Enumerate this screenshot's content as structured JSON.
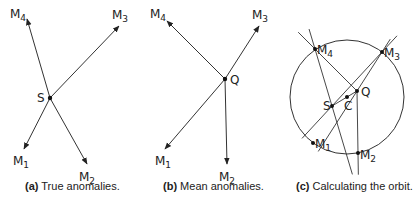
{
  "figure": {
    "panels": [
      {
        "id": "a",
        "caption_tag": "(a)",
        "caption_text": "True anomalies.",
        "center_label": "S",
        "center": [
          50,
          98
        ],
        "arrows": [
          {
            "label": "M",
            "sub": "1",
            "tip": [
              24,
              149
            ],
            "label_pos": [
              13,
              165
            ]
          },
          {
            "label": "M",
            "sub": "2",
            "tip": [
              87,
              164
            ],
            "label_pos": [
              79,
              181
            ]
          },
          {
            "label": "M",
            "sub": "3",
            "tip": [
              119,
              26
            ],
            "label_pos": [
              112,
              19
            ]
          },
          {
            "label": "M",
            "sub": "4",
            "tip": [
              27,
              19
            ],
            "label_pos": [
              10,
              18
            ]
          }
        ]
      },
      {
        "id": "b",
        "caption_tag": "(b)",
        "caption_text": "Mean anomalies.",
        "center_label": "Q",
        "center": [
          225,
          79
        ],
        "arrows": [
          {
            "label": "M",
            "sub": "1",
            "tip": [
              165,
              149
            ],
            "label_pos": [
              155,
              165
            ]
          },
          {
            "label": "M",
            "sub": "2",
            "tip": [
              227,
              164
            ],
            "label_pos": [
              219,
              181
            ]
          },
          {
            "label": "M",
            "sub": "3",
            "tip": [
              259,
              26
            ],
            "label_pos": [
              252,
              19
            ]
          },
          {
            "label": "M",
            "sub": "4",
            "tip": [
              167,
              21
            ],
            "label_pos": [
              150,
              18
            ]
          }
        ]
      },
      {
        "id": "c",
        "caption_tag": "(c)",
        "caption_text": "Calculating the orbit.",
        "circle": {
          "cx": 347,
          "cy": 97,
          "r": 57
        },
        "points": {
          "S": [
            332,
            106
          ],
          "Q": [
            357,
            91
          ],
          "C": [
            347,
            97
          ],
          "M1": [
            313,
            143
          ],
          "M2": [
            358,
            153
          ],
          "M3": [
            382,
            52
          ],
          "M4": [
            315,
            49
          ]
        },
        "labels": [
          "S",
          "Q",
          "C",
          "M1",
          "M2",
          "M3",
          "M4"
        ]
      }
    ]
  }
}
